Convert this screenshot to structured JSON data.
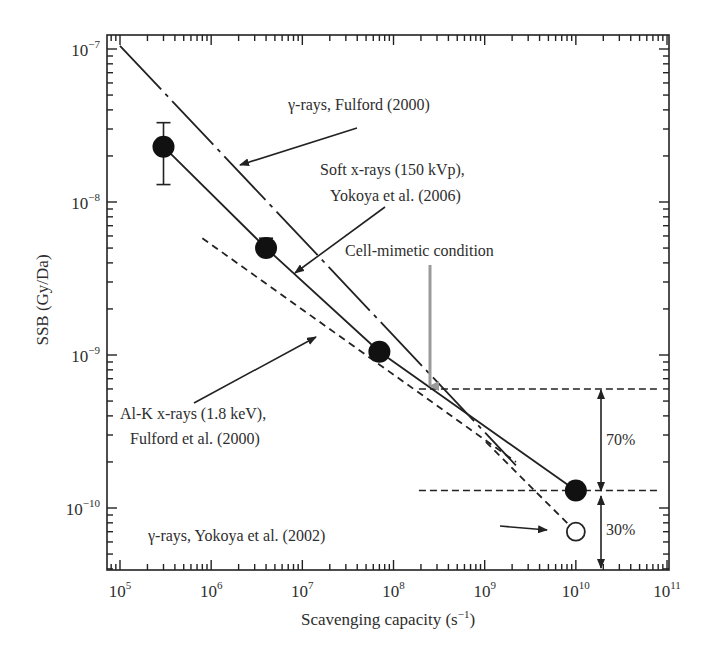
{
  "chart_data": {
    "type": "scatter",
    "title": "",
    "xlabel": "Scavenging capacity (s⁻¹)",
    "ylabel": "SSB (Gy/Da)",
    "xscale": "log",
    "yscale": "log",
    "xlim": [
      80000,
      140000000000
    ],
    "ylim": [
      4.2e-11,
      1.25e-07
    ],
    "grid": false,
    "x_ticks": [
      {
        "value": 100000.0,
        "label": "10",
        "exp": "5"
      },
      {
        "value": 1000000.0,
        "label": "10",
        "exp": "6"
      },
      {
        "value": 10000000.0,
        "label": "10",
        "exp": "7"
      },
      {
        "value": 100000000.0,
        "label": "10",
        "exp": "8"
      },
      {
        "value": 1000000000.0,
        "label": "10",
        "exp": "9"
      },
      {
        "value": 10000000000.0,
        "label": "10",
        "exp": "10"
      },
      {
        "value": 100000000000.0,
        "label": "10",
        "exp": "11"
      }
    ],
    "y_ticks": [
      {
        "value": 1e-07,
        "label": "10",
        "exp": "−7"
      },
      {
        "value": 1e-08,
        "label": "10",
        "exp": "−8"
      },
      {
        "value": 1e-09,
        "label": "10",
        "exp": "−9"
      },
      {
        "value": 1e-10,
        "label": "10",
        "exp": "−10"
      }
    ],
    "series": [
      {
        "name": "Soft x-rays (150 kVp), Yokoya et al. (2006)",
        "style": "solid-line-with-filled-markers",
        "points": [
          {
            "x": 300000.0,
            "y": 2.3e-08,
            "err_low": 1.3e-08,
            "err_high": 3.3e-08
          },
          {
            "x": 4000000.0,
            "y": 5e-09,
            "err_low": 4.5e-09,
            "err_high": 5.8e-09
          },
          {
            "x": 70000000.0,
            "y": 1.05e-09
          },
          {
            "x": 10000000000.0,
            "y": 1.3e-10
          }
        ]
      },
      {
        "name": "γ-rays, Fulford (2000)",
        "style": "dash-dot-line",
        "points": [
          {
            "x": 100000.0,
            "y": 1.05e-07
          },
          {
            "x": 2200000000.0,
            "y": 1.9e-10
          }
        ]
      },
      {
        "name": "Al-K x-rays (1.8 keV), Fulford et al. (2000)",
        "style": "dashed-line",
        "points": [
          {
            "x": 800000.0,
            "y": 5.8e-09
          },
          {
            "x": 2200000000.0,
            "y": 2e-10
          }
        ]
      },
      {
        "name": "γ-rays, Yokoya et al. (2002)",
        "style": "open-marker",
        "points": [
          {
            "x": 10000000000.0,
            "y": 7e-11
          }
        ]
      }
    ],
    "reference_lines": [
      {
        "orientation": "horizontal",
        "y": 6e-10,
        "x_from": 190000000.0,
        "x_to": 80000000000.0,
        "style": "dashed"
      },
      {
        "orientation": "horizontal",
        "y": 1.3e-10,
        "x_from": 190000000.0,
        "x_to": 80000000000.0,
        "style": "dashed"
      }
    ],
    "annotations": [
      {
        "text": "γ-rays, Fulford (2000)",
        "target": "dash-dot line"
      },
      {
        "text": "Soft x-rays (150 kVp),",
        "text2": "Yokoya et al. (2006)",
        "target": "solid line"
      },
      {
        "text": "Cell-mimetic condition",
        "target_x": 300000000.0,
        "color": "#9a9a9a"
      },
      {
        "text": "Al-K x-rays (1.8 keV),",
        "text2": "Fulford et al. (2000)",
        "target": "dashed line"
      },
      {
        "text": "γ-rays, Yokoya et al. (2002)",
        "target": "open circle"
      },
      {
        "text": "70%",
        "between": [
          6e-10,
          1.3e-10
        ]
      },
      {
        "text": "30%",
        "between": [
          1.3e-10,
          "x-axis"
        ]
      }
    ],
    "legend": "none (inline annotations)"
  },
  "labels": {
    "xlabel_main": "Scavenging capacity ",
    "xlabel_unit_open": "(s",
    "xlabel_unit_exp": "−1",
    "xlabel_unit_close": ")",
    "ylabel": "SSB (Gy/Da)",
    "ann_fulford_gamma": "γ-rays, Fulford (2000)",
    "ann_soft_1": "Soft x-rays (150 kVp),",
    "ann_soft_2": "Yokoya et al. (2006)",
    "ann_cell": "Cell-mimetic condition",
    "ann_alk_1": "Al-K x-rays (1.8 keV),",
    "ann_alk_2": "Fulford et al. (2000)",
    "ann_yokoya_gamma": "γ-rays, Yokoya et al. (2002)",
    "pct_70": "70%",
    "pct_30": "30%"
  },
  "colors": {
    "ink": "#222222",
    "text": "#2e2e2e",
    "cell_arrow": "#9a9a9a",
    "background": "#ffffff"
  }
}
